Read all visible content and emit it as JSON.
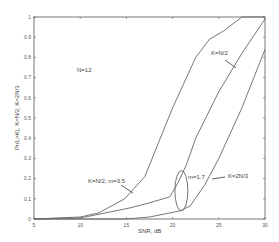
{
  "chart_data": {
    "type": "line",
    "title": "",
    "xlabel": "SNR, dB",
    "ylabel": "Pr(L>K), K=N/2, K=2N/3",
    "xlim": [
      5,
      30
    ],
    "ylim": [
      0,
      1
    ],
    "grid": false,
    "x_ticks": [
      5,
      10,
      15,
      20,
      25,
      30
    ],
    "y_ticks": [
      0,
      0.1,
      0.2,
      0.3,
      0.4,
      0.5,
      0.6,
      0.7,
      0.8,
      0.9,
      1
    ],
    "y_tick_labels": [
      "0",
      "0.1",
      "0.2",
      "0.3",
      "0.4",
      "0.5",
      "0.6",
      "0.7",
      "0.8",
      "0.9",
      "1"
    ],
    "series": [
      {
        "name": "K=N/2; m=3.5",
        "x": [
          5,
          10,
          12,
          14.8,
          17,
          18.5,
          20,
          22.5,
          24,
          25.5,
          27.5,
          30
        ],
        "y": [
          0,
          0.01,
          0.03,
          0.1,
          0.21,
          0.38,
          0.55,
          0.8,
          0.89,
          0.93,
          1.0,
          1.0
        ]
      },
      {
        "name": "K=N/2",
        "x": [
          5,
          10,
          15.4,
          17.5,
          19.7,
          20.6,
          21.5,
          22.5,
          25,
          27.5,
          30
        ],
        "y": [
          0,
          0.005,
          0.055,
          0.08,
          0.11,
          0.18,
          0.27,
          0.4,
          0.63,
          0.82,
          0.99
        ],
        "color": "#666666"
      },
      {
        "name": "K=2N/3",
        "x": [
          5,
          15,
          17.5,
          20.8,
          21.9,
          23.5,
          25,
          27.5,
          30
        ],
        "y": [
          0,
          0.0,
          0.01,
          0.04,
          0.065,
          0.17,
          0.3,
          0.55,
          0.84
        ]
      }
    ],
    "annotations": [
      {
        "text": "N=12",
        "x": 11.5,
        "y": 0.74
      },
      {
        "text": "K=N/2",
        "x": 24.6,
        "y": 0.82
      },
      {
        "text": "K=N/2; m=3.5",
        "x": 11.8,
        "y": 0.17
      },
      {
        "text": "m=1.7",
        "x": 21.6,
        "y": 0.2
      },
      {
        "text": "K=2N/3",
        "x": 26.2,
        "y": 0.2
      }
    ],
    "ellipse": {
      "cx": 20.95,
      "cy": 0.14,
      "rx_db": 0.7,
      "ry": 0.1
    }
  },
  "colors": {
    "axis": "#555555",
    "curve": "#666666",
    "background": "#ffffff"
  }
}
